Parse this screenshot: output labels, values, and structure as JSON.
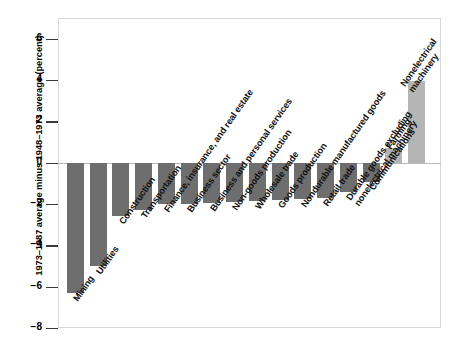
{
  "chart_data": {
    "type": "bar",
    "title": "",
    "subtitle": "",
    "xlabel": "",
    "ylabel": "1973–1987 average minus 1948–1973 average (percent)",
    "ylim": [
      -8,
      7
    ],
    "yticks": [
      6,
      4,
      2,
      0,
      -2,
      -4,
      -6,
      -8
    ],
    "ytick_labels": [
      "6",
      "4",
      "2",
      "0",
      "−2",
      "−4",
      "−6",
      "−8"
    ],
    "grid": false,
    "legend": "none",
    "categories": [
      "Mining",
      "Utilities",
      "Construction",
      "Transportation",
      "Finance, insurance, and real estate",
      "Business sector",
      "Business and personal services",
      "Non-goods production",
      "Wholesale trade",
      "Goods production",
      "Nondurable manufactured goods",
      "Retail trade",
      "Durable goods excluding nonelectrical machinery",
      "Communications",
      "Farming",
      "Nonelectrical machinery"
    ],
    "values": [
      -6.3,
      -5.0,
      -2.6,
      -2.3,
      -2.0,
      -2.0,
      -1.95,
      -1.9,
      -1.85,
      -1.8,
      -1.75,
      -1.7,
      -1.4,
      -0.95,
      0.7,
      3.95
    ],
    "bar_colors": [
      "#6e6e6e",
      "#6e6e6e",
      "#6e6e6e",
      "#6e6e6e",
      "#6e6e6e",
      "#6e6e6e",
      "#6e6e6e",
      "#6e6e6e",
      "#6e6e6e",
      "#6e6e6e",
      "#6e6e6e",
      "#6e6e6e",
      "#6e6e6e",
      "#6e6e6e",
      "#b5b5b5",
      "#b5b5b5"
    ]
  },
  "colors": {
    "negative_bar": "#6e6e6e",
    "positive_bar": "#b5b5b5",
    "axis": "#3a3a3a",
    "baseline": "#b9b9b9",
    "frame": "#d8d8d8",
    "text": "#000000",
    "background": "#ffffff"
  }
}
